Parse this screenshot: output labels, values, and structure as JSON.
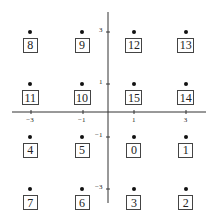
{
  "figure": {
    "type": "constellation-diagram",
    "axes": {
      "x_ticks": [
        {
          "label": "−3",
          "value": -3
        },
        {
          "label": "−1",
          "value": -1
        },
        {
          "label": "1",
          "value": 1
        },
        {
          "label": "3",
          "value": 3
        }
      ],
      "y_ticks": [
        {
          "label": "3",
          "value": 3
        },
        {
          "label": "1",
          "value": 1
        },
        {
          "label": "−1",
          "value": -1
        },
        {
          "label": "−3",
          "value": -3
        }
      ]
    },
    "points": [
      {
        "x": -3,
        "y": 3,
        "label": "8"
      },
      {
        "x": -1,
        "y": 3,
        "label": "9"
      },
      {
        "x": 1,
        "y": 3,
        "label": "12"
      },
      {
        "x": 3,
        "y": 3,
        "label": "13"
      },
      {
        "x": -3,
        "y": 1,
        "label": "11"
      },
      {
        "x": -1,
        "y": 1,
        "label": "10"
      },
      {
        "x": 1,
        "y": 1,
        "label": "15"
      },
      {
        "x": 3,
        "y": 1,
        "label": "14"
      },
      {
        "x": -3,
        "y": -1,
        "label": "4"
      },
      {
        "x": -1,
        "y": -1,
        "label": "5"
      },
      {
        "x": 1,
        "y": -1,
        "label": "0"
      },
      {
        "x": 3,
        "y": -1,
        "label": "1"
      },
      {
        "x": -3,
        "y": -3,
        "label": "7"
      },
      {
        "x": -1,
        "y": -3,
        "label": "6"
      },
      {
        "x": 1,
        "y": -3,
        "label": "3"
      },
      {
        "x": 3,
        "y": -3,
        "label": "2"
      }
    ]
  },
  "chart_data": {
    "type": "scatter",
    "title": "",
    "xlabel": "",
    "ylabel": "",
    "xlim": [
      -4,
      4
    ],
    "ylim": [
      -4,
      4
    ],
    "grid": false,
    "x_ticks": [
      -3,
      -1,
      1,
      3
    ],
    "y_ticks": [
      -3,
      -1,
      1,
      3
    ],
    "series": [
      {
        "name": "16-QAM constellation",
        "points": [
          {
            "x": -3,
            "y": 3,
            "label": "8"
          },
          {
            "x": -1,
            "y": 3,
            "label": "9"
          },
          {
            "x": 1,
            "y": 3,
            "label": "12"
          },
          {
            "x": 3,
            "y": 3,
            "label": "13"
          },
          {
            "x": -3,
            "y": 1,
            "label": "11"
          },
          {
            "x": -1,
            "y": 1,
            "label": "10"
          },
          {
            "x": 1,
            "y": 1,
            "label": "15"
          },
          {
            "x": 3,
            "y": 1,
            "label": "14"
          },
          {
            "x": -3,
            "y": -1,
            "label": "4"
          },
          {
            "x": -1,
            "y": -1,
            "label": "5"
          },
          {
            "x": 1,
            "y": -1,
            "label": "0"
          },
          {
            "x": 3,
            "y": -1,
            "label": "1"
          },
          {
            "x": -3,
            "y": -3,
            "label": "7"
          },
          {
            "x": -1,
            "y": -3,
            "label": "6"
          },
          {
            "x": 1,
            "y": -3,
            "label": "3"
          },
          {
            "x": 3,
            "y": -3,
            "label": "2"
          }
        ]
      }
    ]
  }
}
